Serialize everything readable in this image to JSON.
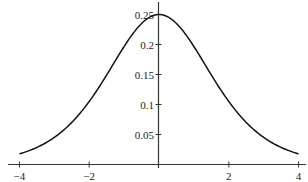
{
  "chart_data": {
    "type": "line",
    "title": "",
    "xlabel": "",
    "ylabel": "",
    "xlim": [
      -4,
      4
    ],
    "ylim": [
      0,
      0.25
    ],
    "grid": false,
    "legend": null,
    "x_ticks": [
      -4,
      -2,
      2,
      4
    ],
    "x_tick_labels": [
      "−4",
      "−2",
      "2",
      "4"
    ],
    "y_ticks": [
      0.05,
      0.1,
      0.15,
      0.2,
      0.25
    ],
    "y_tick_labels": [
      "0.05",
      "0.1",
      "0.15",
      "0.2",
      "0.25"
    ],
    "series": [
      {
        "name": "logistic density",
        "color": "#111111",
        "x": [
          -4,
          -3.5,
          -3,
          -2.5,
          -2,
          -1.5,
          -1,
          -0.5,
          0,
          0.5,
          1,
          1.5,
          2,
          2.5,
          3,
          3.5,
          4
        ],
        "y": [
          0.0177,
          0.0285,
          0.0452,
          0.0701,
          0.105,
          0.1491,
          0.1966,
          0.235,
          0.25,
          0.235,
          0.1966,
          0.1491,
          0.105,
          0.0701,
          0.0452,
          0.0285,
          0.0177
        ]
      }
    ]
  }
}
